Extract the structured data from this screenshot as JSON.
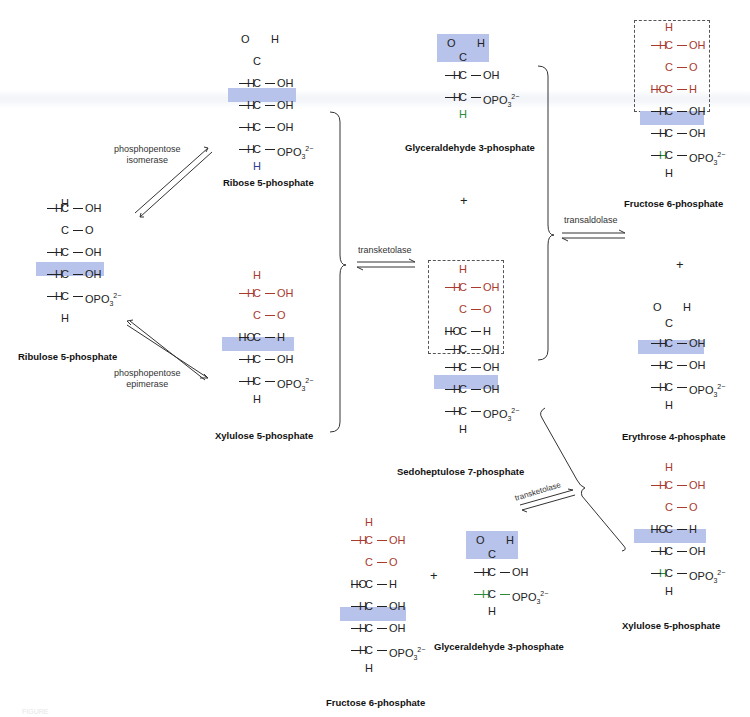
{
  "diagram": {
    "colors": {
      "highlight": "#b7c3ea",
      "transferred_unit": "#a83a2e",
      "bonds": "#222222",
      "green_label": "#2a8a3a"
    },
    "enzymes": {
      "isomerase": [
        "phosphopentose",
        "isomerase"
      ],
      "epimerase": [
        "phosphopentose",
        "epimerase"
      ],
      "transketolase_1": "transketolase",
      "transaldolase": "transaldolase",
      "transketolase_2": "transketolase"
    },
    "plus": "+",
    "molecules": {
      "ribulose5p": {
        "name": "Ribulose 5-phosphate",
        "rows": [
          "H",
          "H—C—OH",
          "C=O",
          "H—C—OH",
          "H—C—OH",
          "H—C—OPO₃²⁻",
          "H"
        ]
      },
      "ribose5p": {
        "name": "Ribose 5-phosphate",
        "rows": [
          "O=C—H (aldehyde)",
          "H—C—OH",
          "H—C—OH",
          "H—C—OH",
          "H—C—OPO₃²⁻",
          "H"
        ]
      },
      "xylulose5p_1": {
        "name": "Xylulose 5-phosphate",
        "rows": [
          "H",
          "H—C—OH",
          "C=O",
          "HO—C—H",
          "H—C—OH",
          "H—C—OPO₃²⁻",
          "H"
        ]
      },
      "glyceraldehyde3p_1": {
        "name": "Glyceraldehyde 3-phosphate",
        "rows": [
          "O=C—H (aldehyde)",
          "H—C—OH",
          "H—C—OPO₃²⁻",
          "H"
        ]
      },
      "sedoheptulose7p": {
        "name": "Sedoheptulose 7-phosphate",
        "rows": [
          "H",
          "H—C—OH",
          "C=O",
          "HO—C—H",
          "H—C—OH",
          "H—C—OH",
          "H—C—OH",
          "H—C—OPO₃²⁻",
          "H"
        ]
      },
      "fructose6p_1": {
        "name": "Fructose 6-phosphate",
        "rows": [
          "H",
          "H—C—OH",
          "C=O",
          "HO—C—H",
          "H—C—OH",
          "H—C—OH",
          "H—C—OPO₃²⁻",
          "H"
        ]
      },
      "erythrose4p": {
        "name": "Erythrose 4-phosphate",
        "rows": [
          "O=C—H (aldehyde)",
          "H—C—OH",
          "H—C—OH",
          "H—C—OPO₃²⁻",
          "H"
        ]
      },
      "xylulose5p_2": {
        "name": "Xylulose 5-phosphate",
        "rows": [
          "H",
          "H—C—OH",
          "C=O",
          "HO—C—H",
          "H—C—OH",
          "H—C—OPO₃²⁻",
          "H"
        ]
      },
      "fructose6p_2": {
        "name": "Fructose 6-phosphate",
        "rows": [
          "H",
          "H—C—OH",
          "C=O",
          "HO—C—H",
          "H—C—OH",
          "H—C—OH",
          "H—C—OPO₃²⁻",
          "H"
        ]
      },
      "glyceraldehyde3p_2": {
        "name": "Glyceraldehyde 3-phosphate",
        "rows": [
          "O=C—H (aldehyde)",
          "H—C—OH",
          "H—C—OPO₃²⁻",
          "H"
        ]
      }
    },
    "atoms": {
      "H": "H",
      "C": "C",
      "O": "O",
      "OH": "OH",
      "HO": "HO",
      "eq": "=",
      "opo3": "OPO",
      "sub3": "3",
      "charge": "2−"
    },
    "figure_label": "FIGURE"
  }
}
